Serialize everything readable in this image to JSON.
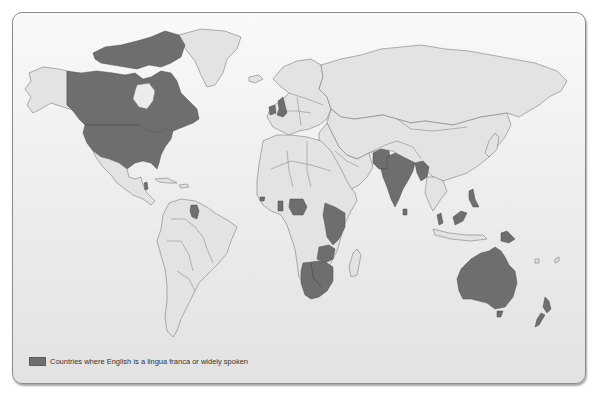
{
  "map": {
    "title": "World map of English-speaking countries",
    "colors": {
      "highlight": "#6e6e6e",
      "land": "#e3e3e3",
      "ocean_top": "#f9f9f9",
      "ocean_bottom": "#e2e2e2",
      "border": "#7d7d7d"
    },
    "highlighted_regions": [
      "Canada",
      "United States",
      "Belize",
      "Guyana",
      "Ireland",
      "United Kingdom",
      "Sierra Leone",
      "Liberia",
      "Ghana",
      "Nigeria",
      "Cameroon",
      "Sudan",
      "Uganda",
      "Kenya",
      "Tanzania",
      "Zambia",
      "Malawi",
      "Zimbabwe",
      "Namibia",
      "Botswana",
      "South Africa",
      "Lesotho",
      "Swaziland",
      "Pakistan",
      "India",
      "Bangladesh",
      "Sri Lanka",
      "Myanmar",
      "Malaysia",
      "Singapore",
      "Brunei",
      "Philippines",
      "Papua New Guinea",
      "Australia",
      "New Zealand"
    ]
  },
  "legend": {
    "label": "Countries where English is a lingua franca or widely spoken"
  }
}
